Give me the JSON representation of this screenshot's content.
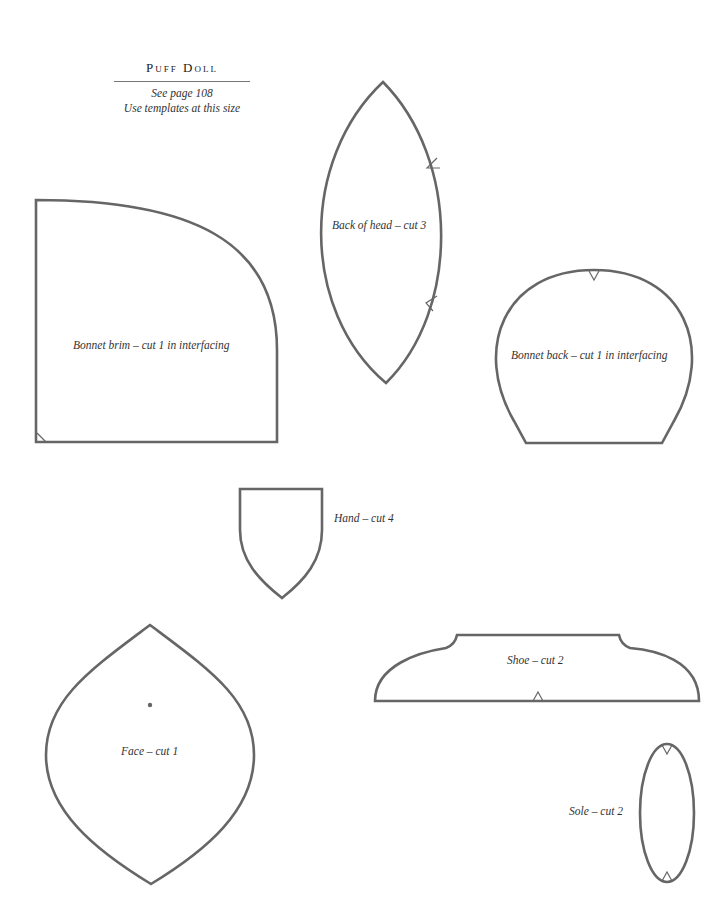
{
  "header": {
    "title": "Puff Doll",
    "page_ref": "See page 108",
    "instruction": "Use templates at this size"
  },
  "templates": [
    {
      "id": "back-of-head",
      "label": "Back of head – cut 3"
    },
    {
      "id": "bonnet-brim",
      "label": "Bonnet brim – cut 1 in interfacing"
    },
    {
      "id": "bonnet-back",
      "label": "Bonnet back – cut 1 in interfacing"
    },
    {
      "id": "hand",
      "label": "Hand – cut 4"
    },
    {
      "id": "shoe",
      "label": "Shoe – cut 2"
    },
    {
      "id": "face",
      "label": "Face – cut 1"
    },
    {
      "id": "sole",
      "label": "Sole – cut 2"
    }
  ],
  "colors": {
    "outline": "#666666",
    "text": "#333333",
    "background": "#ffffff"
  }
}
